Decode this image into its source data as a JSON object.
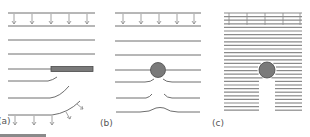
{
  "figure": {
    "panels": [
      {
        "id": "a",
        "label": "(a)",
        "description": "Flow lines deflected by a thin plate; arrows indicate flux direction"
      },
      {
        "id": "b",
        "label": "(b)",
        "description": "Flow lines around a circular obstacle"
      },
      {
        "id": "c",
        "label": "(c)",
        "description": "Dense flow lines with wake/shadow region below circular obstacle"
      }
    ],
    "colors": {
      "line": "#6e6e6e",
      "obstacle": "#7a7a7a",
      "obstacle_outline": "#4a4a4a",
      "background": "#ffffff"
    }
  }
}
